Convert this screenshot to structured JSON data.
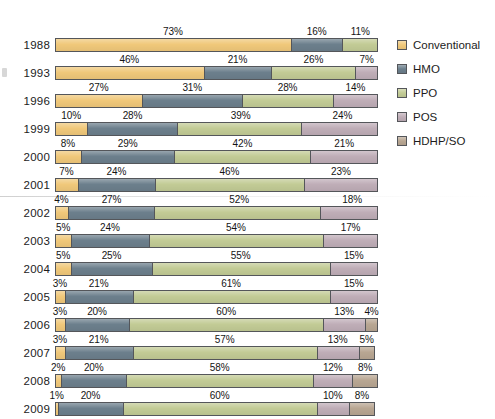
{
  "chart_data": {
    "type": "bar",
    "title": "",
    "subtitle": "",
    "xlabel": "",
    "ylabel": "",
    "orientation": "horizontal",
    "stacked": true,
    "normalized": true,
    "xlim": [
      0,
      100
    ],
    "grid": false,
    "legend_position": "right",
    "categories": [
      "1988",
      "1993",
      "1996",
      "1999",
      "2000",
      "2001",
      "2002",
      "2003",
      "2004",
      "2005",
      "2006",
      "2007",
      "2008",
      "2009"
    ],
    "series": [
      {
        "name": "Conventional",
        "color": "#F0C87A",
        "values": [
          73,
          46,
          27,
          10,
          8,
          7,
          4,
          5,
          5,
          3,
          3,
          3,
          2,
          1
        ]
      },
      {
        "name": "HMO",
        "color": "#6C7F8C",
        "values": [
          16,
          21,
          31,
          28,
          29,
          24,
          27,
          24,
          25,
          21,
          20,
          21,
          20,
          20
        ]
      },
      {
        "name": "PPO",
        "color": "#C2CB95",
        "values": [
          11,
          26,
          28,
          39,
          42,
          46,
          52,
          54,
          55,
          61,
          60,
          57,
          58,
          60
        ]
      },
      {
        "name": "POS",
        "color": "#BFADB7",
        "values": [
          0,
          7,
          14,
          24,
          21,
          23,
          18,
          17,
          15,
          15,
          13,
          13,
          12,
          10
        ]
      },
      {
        "name": "HDHP/SO",
        "color": "#B8A692",
        "values": [
          0,
          0,
          0,
          0,
          0,
          0,
          0,
          0,
          0,
          0,
          4,
          5,
          8,
          8
        ]
      }
    ],
    "value_label_suffix": "%",
    "rows": [
      {
        "year": "1988",
        "segments": [
          {
            "series": "Conventional",
            "value": 73,
            "label": "73%"
          },
          {
            "series": "HMO",
            "value": 16,
            "label": "16%"
          },
          {
            "series": "PPO",
            "value": 11,
            "label": "11%"
          }
        ]
      },
      {
        "year": "1993",
        "segments": [
          {
            "series": "Conventional",
            "value": 46,
            "label": "46%"
          },
          {
            "series": "HMO",
            "value": 21,
            "label": "21%"
          },
          {
            "series": "PPO",
            "value": 26,
            "label": "26%"
          },
          {
            "series": "POS",
            "value": 7,
            "label": "7%"
          }
        ]
      },
      {
        "year": "1996",
        "segments": [
          {
            "series": "Conventional",
            "value": 27,
            "label": "27%"
          },
          {
            "series": "HMO",
            "value": 31,
            "label": "31%"
          },
          {
            "series": "PPO",
            "value": 28,
            "label": "28%"
          },
          {
            "series": "POS",
            "value": 14,
            "label": "14%"
          }
        ]
      },
      {
        "year": "1999",
        "segments": [
          {
            "series": "Conventional",
            "value": 10,
            "label": "10%"
          },
          {
            "series": "HMO",
            "value": 28,
            "label": "28%"
          },
          {
            "series": "PPO",
            "value": 39,
            "label": "39%"
          },
          {
            "series": "POS",
            "value": 24,
            "label": "24%"
          }
        ]
      },
      {
        "year": "2000",
        "segments": [
          {
            "series": "Conventional",
            "value": 8,
            "label": "8%"
          },
          {
            "series": "HMO",
            "value": 29,
            "label": "29%"
          },
          {
            "series": "PPO",
            "value": 42,
            "label": "42%"
          },
          {
            "series": "POS",
            "value": 21,
            "label": "21%"
          }
        ]
      },
      {
        "year": "2001",
        "segments": [
          {
            "series": "Conventional",
            "value": 7,
            "label": "7%"
          },
          {
            "series": "HMO",
            "value": 24,
            "label": "24%"
          },
          {
            "series": "PPO",
            "value": 46,
            "label": "46%"
          },
          {
            "series": "POS",
            "value": 23,
            "label": "23%"
          }
        ]
      },
      {
        "year": "2002",
        "segments": [
          {
            "series": "Conventional",
            "value": 4,
            "label": "4%"
          },
          {
            "series": "HMO",
            "value": 27,
            "label": "27%"
          },
          {
            "series": "PPO",
            "value": 52,
            "label": "52%"
          },
          {
            "series": "POS",
            "value": 18,
            "label": "18%"
          }
        ]
      },
      {
        "year": "2003",
        "segments": [
          {
            "series": "Conventional",
            "value": 5,
            "label": "5%"
          },
          {
            "series": "HMO",
            "value": 24,
            "label": "24%"
          },
          {
            "series": "PPO",
            "value": 54,
            "label": "54%"
          },
          {
            "series": "POS",
            "value": 17,
            "label": "17%"
          }
        ]
      },
      {
        "year": "2004",
        "segments": [
          {
            "series": "Conventional",
            "value": 5,
            "label": "5%"
          },
          {
            "series": "HMO",
            "value": 25,
            "label": "25%"
          },
          {
            "series": "PPO",
            "value": 55,
            "label": "55%"
          },
          {
            "series": "POS",
            "value": 15,
            "label": "15%"
          }
        ]
      },
      {
        "year": "2005",
        "segments": [
          {
            "series": "Conventional",
            "value": 3,
            "label": "3%"
          },
          {
            "series": "HMO",
            "value": 21,
            "label": "21%"
          },
          {
            "series": "PPO",
            "value": 61,
            "label": "61%"
          },
          {
            "series": "POS",
            "value": 15,
            "label": "15%"
          }
        ]
      },
      {
        "year": "2006",
        "segments": [
          {
            "series": "Conventional",
            "value": 3,
            "label": "3%"
          },
          {
            "series": "HMO",
            "value": 20,
            "label": "20%"
          },
          {
            "series": "PPO",
            "value": 60,
            "label": "60%"
          },
          {
            "series": "POS",
            "value": 13,
            "label": "13%"
          },
          {
            "series": "HDHP/SO",
            "value": 4,
            "label": "4%"
          }
        ]
      },
      {
        "year": "2007",
        "segments": [
          {
            "series": "Conventional",
            "value": 3,
            "label": "3%"
          },
          {
            "series": "HMO",
            "value": 21,
            "label": "21%"
          },
          {
            "series": "PPO",
            "value": 57,
            "label": "57%"
          },
          {
            "series": "POS",
            "value": 13,
            "label": "13%"
          },
          {
            "series": "HDHP/SO",
            "value": 5,
            "label": "5%"
          }
        ]
      },
      {
        "year": "2008",
        "segments": [
          {
            "series": "Conventional",
            "value": 2,
            "label": "2%"
          },
          {
            "series": "HMO",
            "value": 20,
            "label": "20%"
          },
          {
            "series": "PPO",
            "value": 58,
            "label": "58%"
          },
          {
            "series": "POS",
            "value": 12,
            "label": "12%"
          },
          {
            "series": "HDHP/SO",
            "value": 8,
            "label": "8%"
          }
        ]
      },
      {
        "year": "2009",
        "segments": [
          {
            "series": "Conventional",
            "value": 1,
            "label": "1%"
          },
          {
            "series": "HMO",
            "value": 20,
            "label": "20%"
          },
          {
            "series": "PPO",
            "value": 60,
            "label": "60%"
          },
          {
            "series": "POS",
            "value": 10,
            "label": "10%"
          },
          {
            "series": "HDHP/SO",
            "value": 8,
            "label": "8%"
          }
        ]
      }
    ]
  },
  "legend": {
    "items": [
      {
        "label": "Conventional",
        "color": "#F0C87A",
        "swatch_name": "legend-swatch-conventional"
      },
      {
        "label": "HMO",
        "color": "#6C7F8C",
        "swatch_name": "legend-swatch-hmo"
      },
      {
        "label": "PPO",
        "color": "#C2CB95",
        "swatch_name": "legend-swatch-ppo"
      },
      {
        "label": "POS",
        "color": "#BFADB7",
        "swatch_name": "legend-swatch-pos"
      },
      {
        "label": "HDHP/SO",
        "color": "#B8A692",
        "swatch_name": "legend-swatch-hdhp-so"
      }
    ]
  }
}
